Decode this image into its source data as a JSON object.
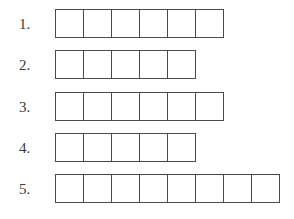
{
  "colors": {
    "border": "#4a4a4a",
    "text": "#3a3a3a",
    "background": "#ffffff"
  },
  "rows": [
    {
      "label": "1.",
      "cells": 6
    },
    {
      "label": "2.",
      "cells": 5
    },
    {
      "label": "3.",
      "cells": 6
    },
    {
      "label": "4.",
      "cells": 5
    },
    {
      "label": "5.",
      "cells": 8
    }
  ]
}
